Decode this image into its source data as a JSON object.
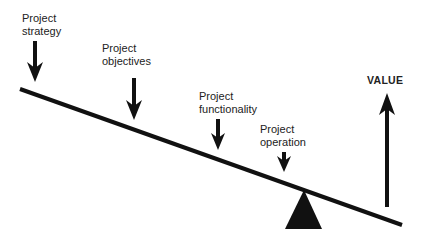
{
  "diagram": {
    "type": "balance-scale",
    "labels": [
      {
        "id": "strategy",
        "line1": "Project",
        "line2": "strategy"
      },
      {
        "id": "objectives",
        "line1": "Project",
        "line2": "objectives"
      },
      {
        "id": "functionality",
        "line1": "Project",
        "line2": "functionality"
      },
      {
        "id": "operation",
        "line1": "Project",
        "line2": "operation"
      }
    ],
    "value_label": "VALUE",
    "colors": {
      "ink": "#111111",
      "background": "#ffffff"
    }
  }
}
